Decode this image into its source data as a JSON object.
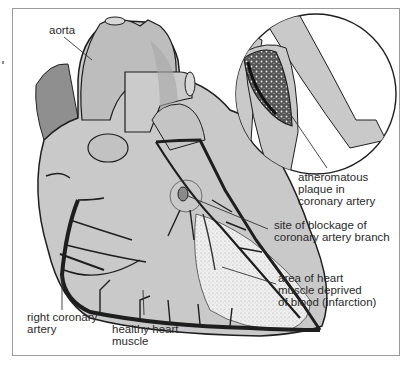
{
  "diagram": {
    "type": "anatomical-illustration",
    "colors": {
      "heart_fill": "#c9c9c9",
      "shading": "#9c9c9c",
      "artery": "#1e1e1e",
      "infarct": "#ececec",
      "frame": "#9a9a9a",
      "text": "#2a2a2a"
    }
  },
  "labels": {
    "aorta": "aorta",
    "plaque": "atheromatous\nplaque in\ncoronary artery",
    "blockage": "site of blockage of\ncoronary artery branch",
    "infarction": "area of heart\nmuscle deprived\nof blood (infarction)",
    "right_coronary": "right coronary\nartery",
    "healthy_muscle": "healthy heart\nmuscle"
  }
}
